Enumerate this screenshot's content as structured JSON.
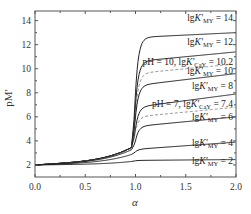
{
  "chart_data": {
    "type": "line",
    "title": "",
    "xlabel": "α",
    "ylabel": "pM'",
    "xlim": [
      0.0,
      2.0
    ],
    "ylim": [
      1.0,
      14.8
    ],
    "x_ticks": [
      0.0,
      0.5,
      1.0,
      1.5,
      2.0
    ],
    "x_tick_labels": [
      "0.0",
      "0.5",
      "1.0",
      "1.5",
      "2.0"
    ],
    "y_ticks": [
      2,
      4,
      6,
      8,
      10,
      12,
      14
    ],
    "y_tick_labels": [
      "2",
      "4",
      "6",
      "8",
      "10",
      "12",
      "14"
    ],
    "grid": false,
    "legend": "inline labels at right",
    "series": [
      {
        "name": "lgK'MY = 14",
        "style": "solid",
        "start": 2.0,
        "before_eq": 3.5,
        "at_eq": 8.0,
        "plateau": 12.6,
        "end": 13.0,
        "label_y": 14.2
      },
      {
        "name": "lgK'MY = 12",
        "style": "solid",
        "start": 2.0,
        "before_eq": 3.5,
        "at_eq": 7.0,
        "plateau": 10.6,
        "end": 11.4,
        "label_y": 12.2
      },
      {
        "name": "pH = 10, lgK'CaY = 10.2",
        "style": "dashed",
        "start": 2.0,
        "before_eq": 3.5,
        "at_eq": 6.2,
        "plateau": 9.6,
        "end": 10.4,
        "label_y": 10.6
      },
      {
        "name": "lgK'MY = 10",
        "style": "solid",
        "start": 2.0,
        "before_eq": 3.5,
        "at_eq": 6.0,
        "plateau": 8.6,
        "end": 9.6,
        "label_y": 9.8
      },
      {
        "name": "lgK'MY = 8",
        "style": "solid",
        "start": 2.0,
        "before_eq": 3.5,
        "at_eq": 5.0,
        "plateau": 6.8,
        "end": 7.9,
        "label_y": 8.6
      },
      {
        "name": "pH = 7, lgK'CaY = 7.4",
        "style": "dashed",
        "start": 2.0,
        "before_eq": 3.4,
        "at_eq": 4.8,
        "plateau": 6.0,
        "end": 6.8,
        "label_y": 7.1
      },
      {
        "name": "lgK'MY = 6",
        "style": "solid",
        "start": 2.0,
        "before_eq": 3.3,
        "at_eq": 4.0,
        "plateau": 5.2,
        "end": 6.0,
        "label_y": 6.0
      },
      {
        "name": "lgK'MY = 4",
        "style": "solid",
        "start": 2.0,
        "before_eq": 2.9,
        "at_eq": 3.1,
        "plateau": 3.3,
        "end": 3.9,
        "label_y": 3.8
      },
      {
        "name": "lgK'MY = 2",
        "style": "solid",
        "start": 2.0,
        "before_eq": 2.3,
        "at_eq": 2.35,
        "plateau": 2.38,
        "end": 2.45,
        "label_y": 2.3
      }
    ]
  },
  "labels": {
    "xlabel": "α",
    "ylabel": "pM'"
  }
}
